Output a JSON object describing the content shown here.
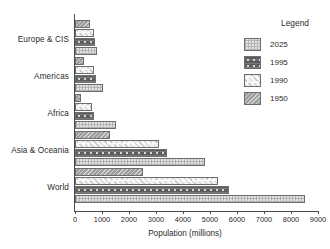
{
  "chart_data": {
    "type": "bar",
    "orientation": "horizontal",
    "title": "",
    "xlabel": "Population (millions)",
    "ylabel": "",
    "xlim": [
      0,
      9000
    ],
    "xticks": [
      0,
      1000,
      2000,
      3000,
      4000,
      5000,
      6000,
      7000,
      8000,
      9000
    ],
    "xtick_labels": [
      "0",
      "1000",
      "2000",
      "3000",
      "4000",
      "5000",
      "6000",
      "7000",
      "8000",
      "9000"
    ],
    "grid": false,
    "categories": [
      "Europe & CIS",
      "Americas",
      "Africa",
      "Asia & Oceania",
      "World"
    ],
    "series": [
      {
        "name": "1950",
        "values": [
          570,
          330,
          220,
          1300,
          2500
        ]
      },
      {
        "name": "1990",
        "values": [
          720,
          720,
          630,
          3100,
          5300
        ]
      },
      {
        "name": "1995",
        "values": [
          730,
          770,
          720,
          3400,
          5700
        ]
      },
      {
        "name": "2025",
        "values": [
          820,
          1050,
          1500,
          4800,
          8500
        ]
      }
    ],
    "legend": {
      "title": "Legend",
      "position": "right",
      "entries": [
        {
          "label": "2025",
          "pattern": "light-checker",
          "color": "#e3e3e3"
        },
        {
          "label": "1995",
          "pattern": "dark-dotted",
          "color": "#5d5d5d"
        },
        {
          "label": "1990",
          "pattern": "white-dotted",
          "color": "#f2f2f2"
        },
        {
          "label": "1950",
          "pattern": "diagonal-hatch",
          "color": "#9d9d9d"
        }
      ]
    }
  }
}
